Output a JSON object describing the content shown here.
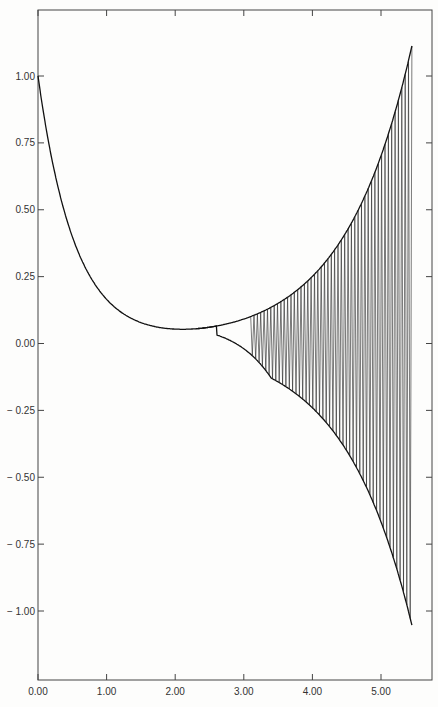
{
  "chart_data": {
    "type": "line",
    "title": "",
    "xlabel": "",
    "ylabel": "",
    "xlim": [
      0,
      5.7
    ],
    "ylim": [
      -1.2,
      1.2
    ],
    "grid": false,
    "legend": null,
    "x_ticks": [
      "0.00",
      "1.00",
      "2.00",
      "3.00",
      "4.00",
      "5.00"
    ],
    "x_tick_values": [
      0,
      1,
      2,
      3,
      4,
      5
    ],
    "y_ticks": [
      "1.00",
      "0.75",
      "0.50",
      "0.25",
      "0.00",
      "− 0.25",
      "− 0.50",
      "− 0.75",
      "− 1.00"
    ],
    "y_tick_values": [
      1.0,
      0.75,
      0.5,
      0.25,
      0.0,
      -0.25,
      -0.5,
      -0.75,
      -1.0
    ],
    "series": [
      {
        "name": "upper envelope",
        "x": [
          0.0,
          0.25,
          0.5,
          0.75,
          1.0,
          1.25,
          1.5,
          1.75,
          2.0,
          2.5,
          3.0,
          3.5,
          4.0,
          4.25,
          4.5,
          4.75,
          5.0,
          5.25,
          5.45
        ],
        "values": [
          1.0,
          0.75,
          0.55,
          0.38,
          0.24,
          0.14,
          0.08,
          0.045,
          0.025,
          0.01,
          0.01,
          0.03,
          0.09,
          0.15,
          0.24,
          0.38,
          0.57,
          0.82,
          1.12
        ]
      },
      {
        "name": "lower envelope",
        "x": [
          0.0,
          0.25,
          0.5,
          0.75,
          1.0,
          1.25,
          1.5,
          1.75,
          2.0,
          2.5,
          3.0,
          3.5,
          4.0,
          4.25,
          4.5,
          4.75,
          5.0,
          5.25,
          5.45
        ],
        "values": [
          1.0,
          0.75,
          0.55,
          0.38,
          0.24,
          0.14,
          0.08,
          0.045,
          0.025,
          0.005,
          -0.01,
          -0.03,
          -0.09,
          -0.15,
          -0.24,
          -0.38,
          -0.57,
          -0.82,
          -1.08
        ]
      },
      {
        "name": "oscillation",
        "description": "rapid oscillation between envelopes beginning near x=3.1, growing to amplitude ~1.1 at x=5.45",
        "start_x": 3.1,
        "end_x": 5.45,
        "cycles": 48
      }
    ]
  }
}
